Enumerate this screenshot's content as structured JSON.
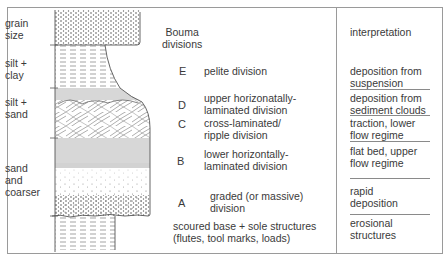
{
  "grain_size_axis": {
    "title": "grain\nsize",
    "labels": [
      {
        "id": "silt-clay",
        "text": "silt +\nclay"
      },
      {
        "id": "silt-sand",
        "text": "silt +\nsand"
      },
      {
        "id": "sand-coarser",
        "text": "sand\nand\ncoarser"
      }
    ]
  },
  "bouma": {
    "header": "Bouma\ndivisions",
    "divisions": [
      {
        "letter": "E",
        "description": "pelite division",
        "interpretation": "deposition from\nsuspension"
      },
      {
        "letter": "D",
        "description": "upper horizonatally-\nlaminated division",
        "interpretation": "deposition from\nsediment clouds"
      },
      {
        "letter": "C",
        "description": "cross-laminated/\nripple division",
        "interpretation": "traction, lower\nflow regime"
      },
      {
        "letter": "B",
        "description": "lower horizontally-\nlaminated division",
        "interpretation": "flat bed, upper\nflow regime"
      },
      {
        "letter": "A",
        "description": "graded (or massive)\ndivision",
        "interpretation": "rapid\ndeposition"
      }
    ],
    "base": {
      "description": "scoured base + sole structures\n(flutes, tool marks, loads)",
      "interpretation": "erosional\nstructures"
    }
  },
  "interpretation_header": "interpretation",
  "colors": {
    "line": "#8a8a8a",
    "text": "#3a3a3a",
    "pattern": "#6a6a6a"
  }
}
